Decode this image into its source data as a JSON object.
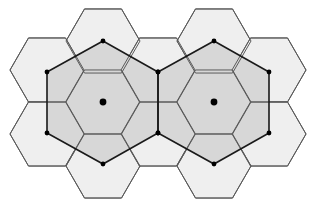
{
  "diagram": {
    "hex_radius": 37,
    "colors": {
      "background": "#ffffff",
      "outer_cell_fill": "#efefef",
      "cluster_fill": "#d7d7d7",
      "cell_stroke": "#5a5a5a",
      "cluster_stroke": "#1a1a1a",
      "node": "#000000"
    },
    "clusters": [
      {
        "center": [
          103,
          102
        ],
        "nodes": [
          [
            103,
            41
          ],
          [
            158,
            72
          ],
          [
            158,
            133
          ],
          [
            103,
            164
          ],
          [
            47,
            133
          ],
          [
            47,
            72
          ]
        ]
      },
      {
        "center": [
          214,
          102
        ],
        "nodes": [
          [
            214,
            41
          ],
          [
            269,
            72
          ],
          [
            269,
            133
          ],
          [
            214,
            164
          ],
          [
            158,
            133
          ],
          [
            158,
            72
          ]
        ]
      }
    ],
    "cells": [
      [
        103,
        41
      ],
      [
        47,
        70
      ],
      [
        47,
        134
      ],
      [
        103,
        166
      ],
      [
        158,
        70
      ],
      [
        158,
        134
      ],
      [
        214,
        41
      ],
      [
        269,
        70
      ],
      [
        269,
        134
      ],
      [
        214,
        166
      ],
      [
        103,
        102
      ],
      [
        214,
        102
      ]
    ]
  }
}
